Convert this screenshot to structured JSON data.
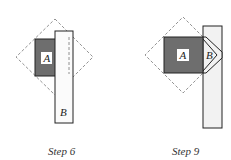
{
  "panels": [
    {
      "id": "step6",
      "caption": "Step 6",
      "piece_a_label": "A",
      "piece_b_label": "B"
    },
    {
      "id": "step9",
      "caption": "Step 9",
      "piece_a_label": "A",
      "piece_b_label": "B"
    }
  ],
  "colors": {
    "piece_a_fill": "#6e6e6e",
    "piece_b_fill": "#f2f2f2",
    "outline": "#222222",
    "dashed": "#777777",
    "label_box": "#ffffff"
  }
}
